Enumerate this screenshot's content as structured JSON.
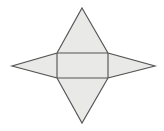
{
  "figure": {
    "title": "Star-shaped geometric net",
    "background_color": "#ffffff",
    "fill_color": "#e7e7e5",
    "stroke_color": "#555555",
    "stroke_width": 1.15,
    "canvas": {
      "width": 164,
      "height": 131
    },
    "parts": [
      {
        "name": "upper-triangle",
        "label": "Upper triangle",
        "points": "82,8 57,53 108,53"
      },
      {
        "name": "lower-triangle",
        "label": "Lower triangle",
        "points": "82,123 57,78 108,78"
      },
      {
        "name": "left-triangle",
        "label": "Left wing triangle",
        "points": "12,66 57,53 57,78"
      },
      {
        "name": "right-triangle",
        "label": "Right wing triangle",
        "points": "155,66 108,53 108,78"
      },
      {
        "name": "left-band",
        "label": "Left band segment",
        "points": "12,66 57,53 108,53 108,78 57,78"
      },
      {
        "name": "center-rectangle",
        "label": "Center rectangle",
        "x": 57,
        "y": 53,
        "width": 51,
        "height": 25
      }
    ],
    "outline": {
      "name": "star-outline",
      "label": "Star outline",
      "points": "82,8 108,53 155,66 108,78 82,123 57,78 12,66 57,53"
    },
    "interior_lines": [
      {
        "name": "rect-top-edge",
        "label": "Rectangle top edge",
        "x1": 57,
        "y1": 53,
        "x2": 108,
        "y2": 53
      },
      {
        "name": "rect-bottom-edge",
        "label": "Rectangle bottom edge",
        "x1": 57,
        "y1": 78,
        "x2": 108,
        "y2": 78
      },
      {
        "name": "rect-left-edge",
        "label": "Rectangle left edge",
        "x1": 57,
        "y1": 53,
        "x2": 57,
        "y2": 78
      },
      {
        "name": "rect-right-edge",
        "label": "Rectangle right edge",
        "x1": 108,
        "y1": 53,
        "x2": 108,
        "y2": 78
      }
    ]
  }
}
